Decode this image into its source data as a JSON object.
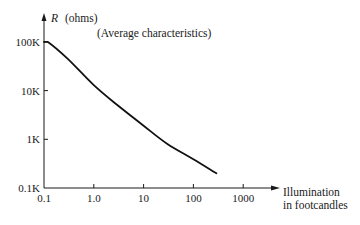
{
  "chart_data": {
    "type": "line",
    "title": "",
    "annotation": "(Average characteristics)",
    "ylabel_symbol": "R",
    "ylabel_unit": "(ohms)",
    "xlabel_lines": [
      "Illumination",
      "in footcandles"
    ],
    "x_scale": "log",
    "y_scale": "log",
    "x_ticks": [
      0.1,
      1.0,
      10,
      100,
      1000
    ],
    "x_tick_labels": [
      "0.1",
      "1.0",
      "10",
      "100",
      "1000"
    ],
    "y_ticks": [
      100,
      1000,
      10000,
      100000
    ],
    "y_tick_labels": [
      "0.1K",
      "1K",
      "10K",
      "100K"
    ],
    "xlim": [
      0.1,
      1000
    ],
    "ylim": [
      100,
      100000
    ],
    "grid": false,
    "legend": null,
    "series": [
      {
        "name": "Resistance vs illumination",
        "x": [
          0.1,
          0.12,
          0.3,
          1.0,
          3.0,
          10,
          30,
          100,
          290
        ],
        "y": [
          100000,
          100000,
          45000,
          13000,
          5000,
          1900,
          800,
          390,
          200
        ]
      }
    ]
  },
  "colors": {
    "axis": "#1a1a1a",
    "curve": "#111111",
    "background": "#ffffff"
  }
}
